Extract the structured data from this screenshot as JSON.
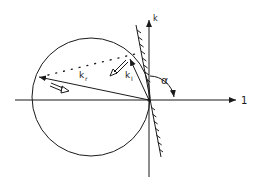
{
  "diagram": {
    "type": "wavevector reflection diagram",
    "labels": {
      "vertical_axis": "k",
      "horizontal_axis": "1",
      "incident_vector": "k",
      "incident_subscript": "I",
      "reflected_vector": "k",
      "reflected_subscript": "r",
      "angle": "α"
    },
    "elements": {
      "circle": {
        "cx": 91,
        "cy": 97,
        "r": 59
      },
      "origin": {
        "x": 149,
        "y": 100
      },
      "hatched_surface": {
        "x1": 136,
        "y1": 25,
        "x2": 161,
        "y2": 157
      },
      "incident_vector_tip": {
        "x": 129,
        "y": 58
      },
      "reflected_vector_tip": {
        "x": 39,
        "y": 77
      }
    },
    "colors": {
      "ink": "#1a1a1a",
      "background": "#ffffff"
    }
  }
}
